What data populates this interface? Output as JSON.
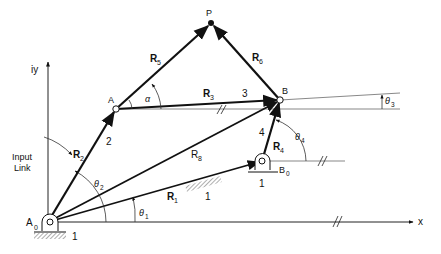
{
  "diagram": {
    "points": {
      "P": "P",
      "A": "A",
      "B": "B",
      "A0": "A",
      "A0_sub": "0",
      "B0": "B",
      "B0_sub": "0"
    },
    "vectors": {
      "R1": "R",
      "R1_sub": "1",
      "R2": "R",
      "R2_sub": "2",
      "R3": "R",
      "R3_sub": "3",
      "R4": "R",
      "R4_sub": "4",
      "R5": "R",
      "R5_sub": "5",
      "R6": "R",
      "R6_sub": "6",
      "R8": "R",
      "R8_sub": "8"
    },
    "link_numbers": {
      "link2": "2",
      "link3": "3",
      "link4": "4",
      "ground_A0": "1",
      "ground_B0": "1",
      "ground_mid": "1"
    },
    "angles": {
      "theta1": "θ",
      "theta1_sub": "1",
      "theta2": "θ",
      "theta2_sub": "2",
      "theta3": "θ",
      "theta3_sub": "3",
      "theta4": "θ",
      "theta4_sub": "4",
      "alpha": "α"
    },
    "annotations": {
      "input_link_line1": "Input",
      "input_link_line2": "Link"
    },
    "axes": {
      "x_label": "x",
      "y_label": "iy"
    },
    "colors": {
      "ink": "#111111",
      "thin": "#555555",
      "background": "#ffffff"
    }
  }
}
